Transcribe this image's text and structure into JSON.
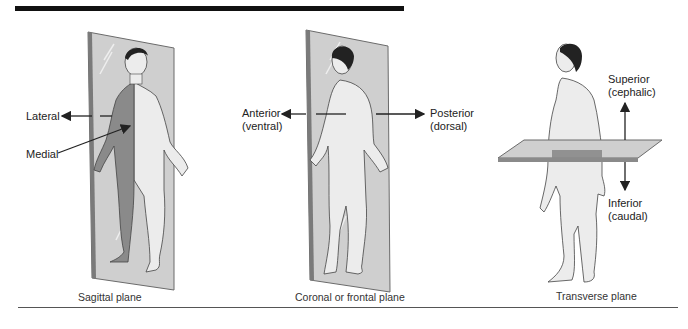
{
  "figure": {
    "panels": [
      {
        "id": "sagittal",
        "caption": "Sagittal plane",
        "labels": {
          "lateral": "Lateral",
          "medial": "Medial"
        }
      },
      {
        "id": "coronal",
        "caption": "Coronal or frontal plane",
        "labels": {
          "anterior": "Anterior",
          "anterior_alt": "(ventral)",
          "posterior": "Posterior",
          "posterior_alt": "(dorsal)"
        }
      },
      {
        "id": "transverse",
        "caption": "Transverse plane",
        "labels": {
          "superior": "Superior",
          "superior_alt": "(cephalic)",
          "inferior": "Inferior",
          "inferior_alt": "(caudal)"
        }
      }
    ],
    "colors": {
      "plane_fill": "#c9c9c9",
      "plane_edge": "#6b6b6b",
      "body_fill": "#ececec",
      "shaded_half": "#8a8a8a",
      "hair": "#222222",
      "rule": "#111111"
    }
  }
}
